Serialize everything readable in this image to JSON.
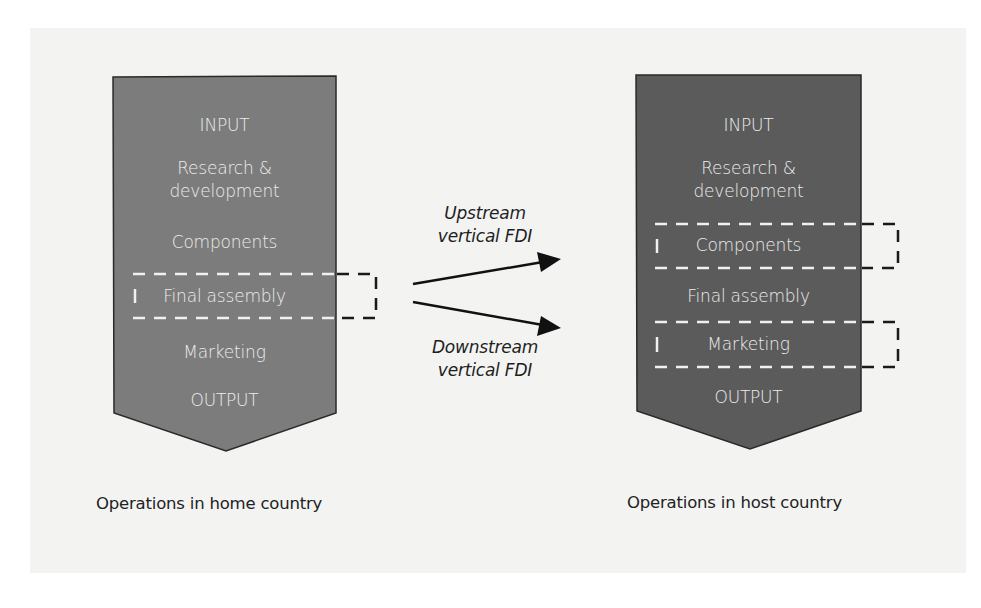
{
  "diagram": {
    "colors": {
      "home_fill": "#7c7c7c",
      "host_fill": "#5b5b5b",
      "stroke": "#2a2a2a",
      "text_on_shape": "#ececec",
      "panel_bg": "#f3f3f2"
    },
    "home": {
      "caption": "Operations in home country",
      "stages": [
        "INPUT",
        "Research &",
        "development",
        "Components",
        "Final assembly",
        "Marketing",
        "OUTPUT"
      ],
      "highlighted": [
        "Final assembly"
      ]
    },
    "host": {
      "caption": "Operations in host country",
      "stages": [
        "INPUT",
        "Research &",
        "development",
        "Components",
        "Final assembly",
        "Marketing",
        "OUTPUT"
      ],
      "highlighted": [
        "Components",
        "Marketing"
      ]
    },
    "arrows": [
      {
        "label_line1": "Upstream",
        "label_line2": "vertical FDI"
      },
      {
        "label_line1": "Downstream",
        "label_line2": "vertical FDI"
      }
    ]
  }
}
